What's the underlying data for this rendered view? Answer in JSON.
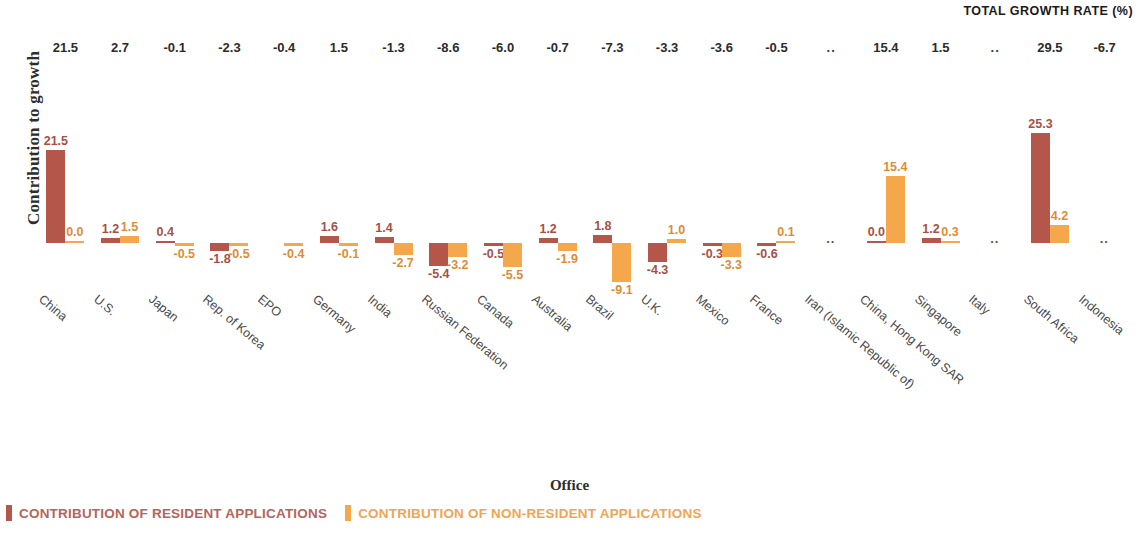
{
  "chart_data": {
    "type": "bar",
    "title": "",
    "xlabel": "Office",
    "ylabel": "Contribution to growth",
    "header_label": "TOTAL GROWTH RATE (%)",
    "grid": false,
    "legend_position": "bottom-left",
    "ylim": [
      -10.5,
      27.0
    ],
    "no_data_symbol": "..",
    "categories": [
      "China",
      "U.S.",
      "Japan",
      "Rep. of Korea",
      "EPO",
      "Germany",
      "India",
      "Russian Federation",
      "Canada",
      "Australia",
      "Brazil",
      "U.K.",
      "Mexico",
      "France",
      "Iran (Islamic Republic of)",
      "China, Hong Kong SAR",
      "Singapore",
      "Italy",
      "South Africa",
      "Indonesia"
    ],
    "total_growth_rate": [
      "21.5",
      "2.7",
      "-0.1",
      "-2.3",
      "-0.4",
      "1.5",
      "-1.3",
      "-8.6",
      "-6.0",
      "-0.7",
      "-7.3",
      "-3.3",
      "-3.6",
      "-0.5",
      "..",
      "15.4",
      "1.5",
      "..",
      "29.5",
      "-6.7"
    ],
    "series": [
      {
        "name": "CONTRIBUTION OF RESIDENT APPLICATIONS",
        "color": "#b5564a",
        "values": [
          21.5,
          1.2,
          0.4,
          -1.8,
          null,
          1.6,
          1.4,
          -5.4,
          -0.5,
          1.2,
          1.8,
          -4.3,
          -0.3,
          -0.6,
          null,
          0.0,
          1.2,
          null,
          25.3,
          null
        ],
        "labels": [
          "21.5",
          "1.2",
          "0.4",
          "-1.8",
          "",
          "1.6",
          "1.4",
          "-5.4",
          "-0.5",
          "1.2",
          "1.8",
          "-4.3",
          "-0.3",
          "-0.6",
          "",
          "0.0",
          "1.2",
          "",
          "25.3",
          ""
        ]
      },
      {
        "name": "CONTRIBUTION OF NON-RESIDENT APPLICATIONS",
        "color": "#f5a74c",
        "values": [
          0.0,
          1.5,
          -0.5,
          -0.5,
          -0.4,
          -0.1,
          -2.7,
          -3.2,
          -5.5,
          -1.9,
          -9.1,
          1.0,
          -3.3,
          0.1,
          null,
          15.4,
          0.3,
          null,
          4.2,
          null
        ],
        "labels": [
          "0.0",
          "1.5",
          "-0.5",
          "-0.5",
          "-0.4",
          "-0.1",
          "-2.7",
          "-3.2",
          "-5.5",
          "-1.9",
          "-9.1",
          "1.0",
          "-3.3",
          "0.1",
          "",
          "15.4",
          "0.3",
          "",
          "4.2",
          ""
        ]
      }
    ]
  },
  "legend": {
    "resident": "CONTRIBUTION OF RESIDENT APPLICATIONS",
    "non_resident": "CONTRIBUTION OF NON-RESIDENT APPLICATIONS"
  }
}
